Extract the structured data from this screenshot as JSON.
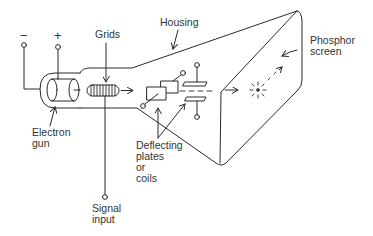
{
  "diagram": {
    "type": "cathode-ray-tube schematic",
    "terminals": {
      "negative": "−",
      "positive": "+"
    },
    "labels": {
      "housing": "Housing",
      "grids": "Grids",
      "phosphor_line1": "Phosphor",
      "phosphor_line2": "screen",
      "electron_line1": "Electron",
      "electron_line2": "gun",
      "deflect_line1": "Deflecting",
      "deflect_line2": "plates",
      "deflect_line3": "or",
      "deflect_line4": "coils",
      "signal_line1": "Signal",
      "signal_line2": "input"
    },
    "colors": {
      "line": "#2a2a2a",
      "text": "#333333",
      "background": "#ffffff"
    }
  }
}
